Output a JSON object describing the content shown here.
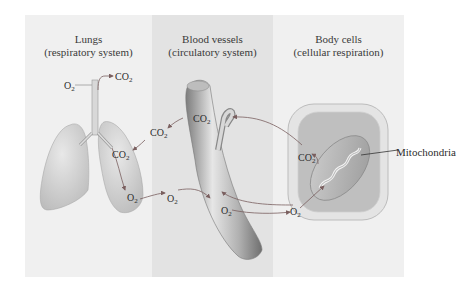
{
  "panels": [
    {
      "title": "Lungs",
      "subtitle": "(respiratory system)"
    },
    {
      "title": "Blood vessels",
      "subtitle": "(circulatory system)"
    },
    {
      "title": "Body cells",
      "subtitle": "(cellular respiration)"
    }
  ],
  "labels": {
    "o2_inhale": "O",
    "co2_exhale": "CO",
    "co2_lung": "CO",
    "o2_lung": "O",
    "co2_between": "CO",
    "co2_vessel": "CO",
    "o2_between": "O",
    "o2_vessel": "O",
    "o2_cell": "O",
    "co2_cell": "CO",
    "subscript": "2",
    "mitochondria": "Mitochondria"
  },
  "colors": {
    "panel_light": "#f0f0f0",
    "panel_mid": "#e3e3e3",
    "arrow": "#8a6a6a",
    "organ": "#c9c9c9"
  }
}
